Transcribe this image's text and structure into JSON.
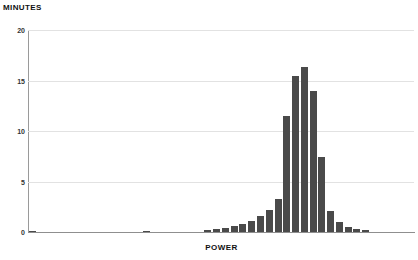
{
  "chart_data": {
    "type": "bar",
    "title": "",
    "subtitle": "",
    "xlabel": "POWER",
    "ylabel": "MINUTES",
    "grid": true,
    "legend": false,
    "legend_position": "none",
    "bar_color": "#4a4a4a",
    "grid_color": "#e2e2e2",
    "axis_color": "#8f8f8f",
    "ylim": [
      0,
      20
    ],
    "yticks": [
      0,
      5,
      10,
      15,
      20
    ],
    "ytick_labels": [
      "0",
      "5",
      "10",
      "15",
      "20"
    ],
    "xlim": [
      0,
      44
    ],
    "xticks": [],
    "xtick_labels": [],
    "categories": [
      "0",
      "1",
      "2",
      "3",
      "4",
      "5",
      "6",
      "7",
      "8",
      "9",
      "10",
      "11",
      "12",
      "13",
      "14",
      "15",
      "16",
      "17",
      "18",
      "19",
      "20",
      "21",
      "22",
      "23",
      "24",
      "25",
      "26",
      "27",
      "28",
      "29",
      "30",
      "31",
      "32",
      "33",
      "34",
      "35",
      "36",
      "37",
      "38",
      "39",
      "40",
      "41",
      "42",
      "43"
    ],
    "values": [
      0.15,
      0,
      0,
      0,
      0,
      0,
      0,
      0,
      0,
      0,
      0,
      0,
      0,
      0.15,
      0,
      0,
      0,
      0,
      0,
      0,
      0.2,
      0.25,
      0.4,
      0.55,
      0.75,
      1.1,
      1.6,
      2.2,
      3.3,
      11.5,
      15.4,
      16.3,
      14.0,
      7.4,
      2.1,
      1.0,
      0.5,
      0.25,
      0.2,
      0,
      0,
      0,
      0,
      0
    ]
  },
  "axis": {
    "y_title": "MINUTES",
    "x_title": "POWER"
  }
}
